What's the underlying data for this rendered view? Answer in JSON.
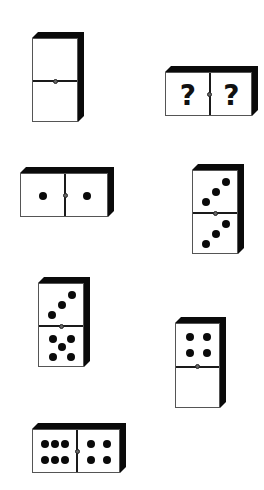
{
  "puzzle": {
    "type": "domino-sequence",
    "dominoes": [
      {
        "id": 1,
        "orientation": "vertical",
        "x": 32,
        "y": 38,
        "w": 46,
        "h": 84,
        "halves": [
          0,
          0
        ]
      },
      {
        "id": 2,
        "orientation": "horizontal",
        "x": 165,
        "y": 72,
        "w": 87,
        "h": 44,
        "halves": [
          "?",
          "?"
        ],
        "unknown": true
      },
      {
        "id": 3,
        "orientation": "horizontal",
        "x": 20,
        "y": 173,
        "w": 88,
        "h": 44,
        "halves": [
          1,
          1
        ]
      },
      {
        "id": 4,
        "orientation": "vertical",
        "x": 192,
        "y": 170,
        "w": 46,
        "h": 84,
        "halves": [
          3,
          3
        ]
      },
      {
        "id": 5,
        "orientation": "vertical",
        "x": 38,
        "y": 283,
        "w": 46,
        "h": 84,
        "halves": [
          3,
          5
        ]
      },
      {
        "id": 6,
        "orientation": "vertical",
        "x": 175,
        "y": 323,
        "w": 45,
        "h": 85,
        "halves": [
          4,
          0
        ]
      },
      {
        "id": 7,
        "orientation": "horizontal",
        "x": 32,
        "y": 429,
        "w": 88,
        "h": 44,
        "halves": [
          6,
          4
        ]
      }
    ],
    "question_mark": "?",
    "colors": {
      "face": "#ffffff",
      "shadow": "#0a0a0a",
      "pip": "#0a0a0a"
    }
  }
}
